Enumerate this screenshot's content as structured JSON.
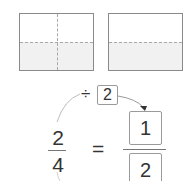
{
  "models": [
    {
      "id": "model-1",
      "total_parts": 4,
      "shaded_parts": 2,
      "divisions": [
        "vertical",
        "horizontal"
      ]
    },
    {
      "id": "model-2",
      "total_parts": 2,
      "shaded_parts": 1,
      "divisions": [
        "horizontal"
      ]
    }
  ],
  "operation": {
    "symbol": "÷",
    "divisor": "2"
  },
  "given_fraction": {
    "numerator": "2",
    "denominator": "4"
  },
  "equals_sign": "=",
  "answer_fraction": {
    "numerator": "1",
    "denominator": "2"
  },
  "colors": {
    "shade": "#f1f1f1",
    "border": "#8a8a8a"
  }
}
